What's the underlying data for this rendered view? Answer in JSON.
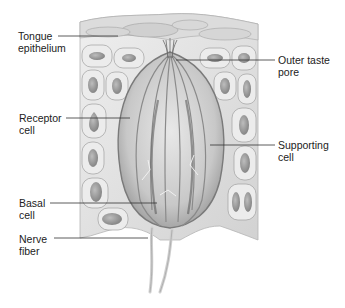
{
  "diagram": {
    "colors": {
      "background": "#ffffff",
      "tissue_light": "#e6e6e6",
      "tissue_mid": "#c4c4c4",
      "tissue_dark": "#8a8a8a",
      "nucleus": "#9a9a9a",
      "label_text": "#222222",
      "leader_line": "#333333"
    },
    "labels": [
      {
        "id": "tongue-epithelium",
        "text": "Tongue\nepithelium",
        "side": "left"
      },
      {
        "id": "outer-taste-pore",
        "text": "Outer taste\npore",
        "side": "right"
      },
      {
        "id": "receptor-cell",
        "text": "Receptor\ncell",
        "side": "left"
      },
      {
        "id": "supporting-cell",
        "text": "Supporting\ncell",
        "side": "right"
      },
      {
        "id": "basal-cell",
        "text": "Basal\ncell",
        "side": "left"
      },
      {
        "id": "nerve-fiber",
        "text": "Nerve\nfiber",
        "side": "left"
      }
    ]
  }
}
